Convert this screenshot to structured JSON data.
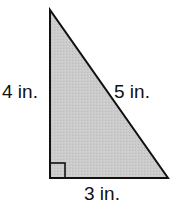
{
  "diagram": {
    "type": "right-triangle",
    "vertices": {
      "top": [
        50,
        10
      ],
      "bottom_left": [
        50,
        178
      ],
      "bottom_right": [
        168,
        178
      ]
    },
    "right_angle_marker_size": 15,
    "fill_color": "#c9c9c9",
    "stroke_color": "#111111",
    "labels": {
      "vertical_leg": "4 in.",
      "hypotenuse": "5 in.",
      "horizontal_leg": "3 in."
    }
  }
}
